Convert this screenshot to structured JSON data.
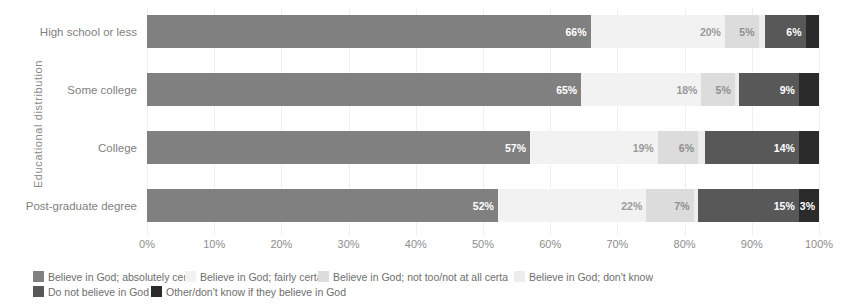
{
  "chart_data": {
    "type": "bar",
    "orientation": "horizontal",
    "stacked": true,
    "stack_mode": "percent",
    "title": "",
    "xlabel": "",
    "ylabel": "Educational distribution",
    "xlim": [
      0,
      100
    ],
    "grid": true,
    "legend_position": "bottom",
    "x_ticks": [
      "0%",
      "10%",
      "20%",
      "30%",
      "40%",
      "50%",
      "60%",
      "70%",
      "80%",
      "90%",
      "100%"
    ],
    "categories": [
      "High school or less",
      "Some college",
      "College",
      "Post-graduate degree"
    ],
    "series": [
      {
        "name": "Believe in God; absolutely certa",
        "color": "#808080",
        "values": [
          66,
          65,
          57,
          52
        ],
        "labels": [
          "66%",
          "65%",
          "57%",
          "52%"
        ]
      },
      {
        "name": "Believe in God; fairly certai",
        "color": "#f2f2f2",
        "values": [
          20,
          18,
          19,
          22
        ],
        "labels": [
          "20%",
          "18%",
          "19%",
          "22%"
        ]
      },
      {
        "name": "Believe in God; not too/not at all certa",
        "color": "#dcdcdc",
        "values": [
          5,
          5,
          6,
          7
        ],
        "labels": [
          "5%",
          "5%",
          "6%",
          "7%"
        ]
      },
      {
        "name": "Believe in God; don't know",
        "color": "#ededed",
        "values": [
          1,
          0,
          1,
          0
        ],
        "labels": [
          "",
          "",
          "",
          ""
        ]
      },
      {
        "name": "Do not believe in God",
        "color": "#585858",
        "values": [
          6,
          9,
          14,
          15
        ],
        "labels": [
          "6%",
          "9%",
          "14%",
          "15%"
        ]
      },
      {
        "name": "Other/don't know if they believe in God",
        "color": "#2b2b2b",
        "values": [
          2,
          3,
          3,
          3
        ],
        "labels": [
          "",
          "",
          "",
          "3%"
        ]
      }
    ],
    "rows": [
      {
        "category": "High school or less",
        "segments": [
          {
            "series": "Believe in God; absolutely certa",
            "value": 66,
            "label": "66%",
            "color": "#808080",
            "text_color": "#ffffff"
          },
          {
            "series": "Believe in God; fairly certai",
            "value": 20,
            "label": "20%",
            "color": "#f2f2f2",
            "text_color": "#9a9a9a"
          },
          {
            "series": "Believe in God; not too/not at all certa",
            "value": 5,
            "label": "5%",
            "color": "#dcdcdc",
            "text_color": "#8f8f8f"
          },
          {
            "series": "Believe in God; don't know",
            "value": 1,
            "label": "",
            "color": "#ededed",
            "text_color": "#9a9a9a"
          },
          {
            "series": "Do not believe in God",
            "value": 6,
            "label": "6%",
            "color": "#585858",
            "text_color": "#ffffff"
          },
          {
            "series": "Other/don't know if they believe in God",
            "value": 2,
            "label": "",
            "color": "#2b2b2b",
            "text_color": "#ffffff"
          }
        ]
      },
      {
        "category": "Some college",
        "segments": [
          {
            "series": "Believe in God; absolutely certa",
            "value": 65,
            "label": "65%",
            "color": "#808080",
            "text_color": "#ffffff"
          },
          {
            "series": "Believe in God; fairly certai",
            "value": 18,
            "label": "18%",
            "color": "#f2f2f2",
            "text_color": "#9a9a9a"
          },
          {
            "series": "Believe in God; not too/not at all certa",
            "value": 5,
            "label": "5%",
            "color": "#dcdcdc",
            "text_color": "#8f8f8f"
          },
          {
            "series": "Believe in God; don't know",
            "value": 0,
            "label": "",
            "color": "#ededed",
            "text_color": "#9a9a9a"
          },
          {
            "series": "Do not believe in God",
            "value": 9,
            "label": "9%",
            "color": "#585858",
            "text_color": "#ffffff"
          },
          {
            "series": "Other/don't know if they believe in God",
            "value": 3,
            "label": "",
            "color": "#2b2b2b",
            "text_color": "#ffffff"
          }
        ]
      },
      {
        "category": "College",
        "segments": [
          {
            "series": "Believe in God; absolutely certa",
            "value": 57,
            "label": "57%",
            "color": "#808080",
            "text_color": "#ffffff"
          },
          {
            "series": "Believe in God; fairly certai",
            "value": 19,
            "label": "19%",
            "color": "#f2f2f2",
            "text_color": "#9a9a9a"
          },
          {
            "series": "Believe in God; not too/not at all certa",
            "value": 6,
            "label": "6%",
            "color": "#dcdcdc",
            "text_color": "#8f8f8f"
          },
          {
            "series": "Believe in God; don't know",
            "value": 1,
            "label": "",
            "color": "#ededed",
            "text_color": "#9a9a9a"
          },
          {
            "series": "Do not believe in God",
            "value": 14,
            "label": "14%",
            "color": "#585858",
            "text_color": "#ffffff"
          },
          {
            "series": "Other/don't know if they believe in God",
            "value": 3,
            "label": "",
            "color": "#2b2b2b",
            "text_color": "#ffffff"
          }
        ]
      },
      {
        "category": "Post-graduate degree",
        "segments": [
          {
            "series": "Believe in God; absolutely certa",
            "value": 52,
            "label": "52%",
            "color": "#808080",
            "text_color": "#ffffff"
          },
          {
            "series": "Believe in God; fairly certai",
            "value": 22,
            "label": "22%",
            "color": "#f2f2f2",
            "text_color": "#9a9a9a"
          },
          {
            "series": "Believe in God; not too/not at all certa",
            "value": 7,
            "label": "7%",
            "color": "#dcdcdc",
            "text_color": "#8f8f8f"
          },
          {
            "series": "Believe in God; don't know",
            "value": 0,
            "label": "",
            "color": "#ededed",
            "text_color": "#9a9a9a"
          },
          {
            "series": "Do not believe in God",
            "value": 15,
            "label": "15%",
            "color": "#585858",
            "text_color": "#ffffff"
          },
          {
            "series": "Other/don't know if they believe in God",
            "value": 3,
            "label": "3%",
            "color": "#2b2b2b",
            "text_color": "#ffffff"
          }
        ]
      }
    ]
  },
  "legend": {
    "rows": [
      [
        {
          "label": "Believe in God; absolutely certa",
          "color": "#808080",
          "width": 152
        },
        {
          "label": "Believe in God; fairly certai",
          "color": "#f2f2f2",
          "width": 133
        },
        {
          "label": "Believe in God; not too/not at all certa",
          "color": "#dcdcdc",
          "width": 196
        },
        {
          "label": "Believe in God; don't know",
          "color": "#ededed",
          "width": 140
        }
      ],
      [
        {
          "label": "Do not believe in God",
          "color": "#585858",
          "width": 118
        },
        {
          "label": "Other/don't know if they believe in God",
          "color": "#2b2b2b",
          "width": 210
        }
      ]
    ]
  }
}
